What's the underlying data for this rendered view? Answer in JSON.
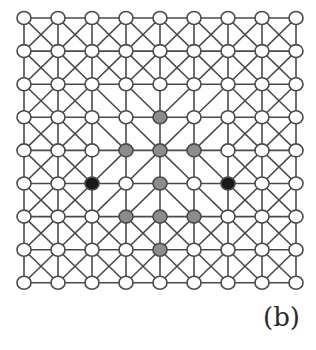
{
  "diagram": {
    "type": "lattice-graph",
    "rows": 9,
    "cols": 9,
    "x0": 24,
    "y0": 18,
    "dx": 34,
    "dy": 33.1,
    "node_radius": 6.5,
    "colors": {
      "edge": "#4a4a4a",
      "empty": "#ffffff",
      "gray": "#8c8c8c",
      "black": "#1a1a1a"
    },
    "center": [
      4,
      4
    ],
    "radial_block": {
      "min": 2,
      "max": 6
    },
    "gray_nodes": [
      [
        3,
        4
      ],
      [
        4,
        3
      ],
      [
        4,
        4
      ],
      [
        4,
        5
      ],
      [
        5,
        4
      ],
      [
        6,
        3
      ],
      [
        6,
        4
      ],
      [
        6,
        5
      ],
      [
        7,
        4
      ]
    ],
    "black_nodes": [
      [
        5,
        2
      ],
      [
        5,
        6
      ]
    ]
  },
  "caption": "(b)"
}
